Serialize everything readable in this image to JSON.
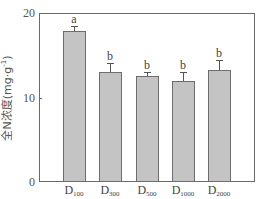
{
  "chart_data": {
    "type": "bar",
    "title": "",
    "xlabel": "",
    "ylabel": "全N浓度(mg·g⁻¹)",
    "ylim": [
      0,
      20
    ],
    "yticks": [
      0,
      10,
      20
    ],
    "grid": false,
    "legend": null,
    "categories": [
      "D100",
      "D300",
      "D500",
      "D1000",
      "D2000"
    ],
    "category_labels": [
      {
        "main": "D",
        "sub": "100"
      },
      {
        "main": "D",
        "sub": "300"
      },
      {
        "main": "D",
        "sub": "500"
      },
      {
        "main": "D",
        "sub": "1000"
      },
      {
        "main": "D",
        "sub": "2000"
      }
    ],
    "values": [
      17.9,
      13.0,
      12.5,
      12.0,
      13.2
    ],
    "error": [
      0.6,
      1.1,
      0.5,
      1.0,
      1.2
    ],
    "significance_letters": [
      "a",
      "b",
      "b",
      "b",
      "b"
    ],
    "bar_color": "#c4c4c4",
    "bar_edge_color": "#6d6d6d"
  },
  "axis": {
    "ytick_labels": [
      "20",
      "10",
      "0"
    ],
    "ylabel_main": "全N浓度(mg·g",
    "ylabel_sup": "-1",
    "ylabel_close": ")"
  }
}
